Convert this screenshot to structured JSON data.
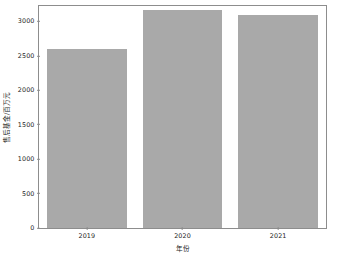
{
  "chart_data": {
    "type": "bar",
    "title": "",
    "subtitle": "",
    "xlabel": "年份",
    "ylabel": "售后基金/百万元",
    "categories": [
      "2019",
      "2020",
      "2021"
    ],
    "values": [
      2600,
      3170,
      3100
    ],
    "series": [
      {
        "name": "售后基金",
        "values": [
          2600,
          3170,
          3100
        ]
      }
    ],
    "ylim": [
      0,
      3225
    ],
    "xlim": [
      0,
      3
    ],
    "yticks": [
      0,
      500,
      1000,
      1500,
      2000,
      2500,
      3000
    ],
    "ytick_labels": [
      "0",
      "500",
      "1000",
      "1500",
      "2000",
      "2500",
      "3000"
    ],
    "xtick_labels": [
      "2019",
      "2020",
      "2021"
    ],
    "grid": false,
    "legend": null,
    "legend_position": "none",
    "bar_color": "#a9a9a9",
    "axis_color": "#8d8d8d",
    "text_color": "#1c1c1c",
    "background_color": "#ffffff",
    "bar_width_fraction": 0.83,
    "annotations": []
  }
}
